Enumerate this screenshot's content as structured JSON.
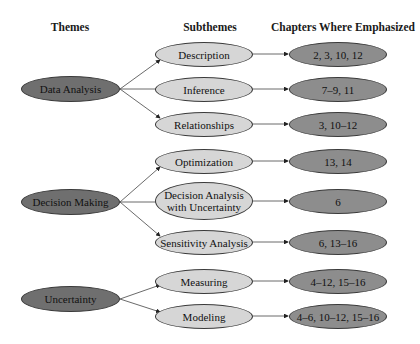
{
  "headers": {
    "themes": "Themes",
    "subthemes": "Subthemes",
    "chapters": "Chapters Where Emphasized"
  },
  "colors": {
    "theme_fill": "#6f6f6f",
    "subtheme_fill": "#d6d6d6",
    "chapter_fill": "#8d8d8d",
    "stroke": "#3a3a3a"
  },
  "themes": [
    {
      "label": "Data Analysis",
      "subthemes": [
        {
          "label": "Description",
          "chapters": "2, 3, 10, 12"
        },
        {
          "label": "Inference",
          "chapters": "7–9, 11"
        },
        {
          "label": "Relationships",
          "chapters": "3, 10–12"
        }
      ]
    },
    {
      "label": "Decision Making",
      "subthemes": [
        {
          "label": "Optimization",
          "chapters": "13, 14"
        },
        {
          "label": "Decision Analysis with Uncertainty",
          "chapters": "6"
        },
        {
          "label": "Sensitivity Analysis",
          "chapters": "6, 13–16"
        }
      ]
    },
    {
      "label": "Uncertainty",
      "subthemes": [
        {
          "label": "Measuring",
          "chapters": "4–12, 15–16"
        },
        {
          "label": "Modeling",
          "chapters": "4–6, 10–12, 15–16"
        }
      ]
    }
  ]
}
